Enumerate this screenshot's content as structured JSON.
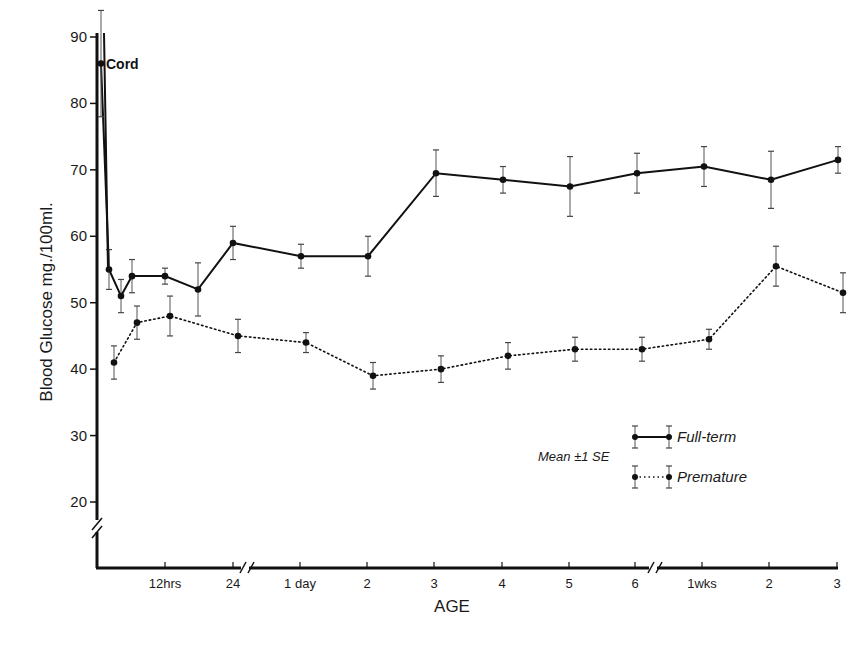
{
  "chart_data": {
    "type": "line",
    "title": "",
    "xlabel": "AGE",
    "ylabel": "Blood Glucose mg./100ml.",
    "ylim": [
      15,
      90
    ],
    "yticks": [
      20,
      30,
      40,
      50,
      60,
      70,
      80,
      90
    ],
    "x_tick_labels": [
      "12hrs",
      "24",
      "1 day",
      "2",
      "3",
      "4",
      "5",
      "6",
      "1wks",
      "2",
      "3"
    ],
    "x_axis_breaks": [
      "after 24 hrs",
      "after 6 days"
    ],
    "y_axis_break": "below 20",
    "annotations": [
      {
        "text": "Cord",
        "series": "Full-term",
        "value": 86
      }
    ],
    "legend": {
      "note": "Mean ±1 SE",
      "entries": [
        {
          "label": "Full-term",
          "style": "solid"
        },
        {
          "label": "Premature",
          "style": "dotted"
        }
      ],
      "position": "lower right"
    },
    "grid": false,
    "series": [
      {
        "name": "Full-term",
        "style": "solid",
        "points": [
          {
            "x": "Cord",
            "y": 86,
            "se": 8
          },
          {
            "x": "~1 hr",
            "y": 55,
            "se": 3
          },
          {
            "x": "~3 hrs",
            "y": 51,
            "se": 2.5
          },
          {
            "x": "~5 hrs",
            "y": 54,
            "se": 2.5
          },
          {
            "x": "12 hrs",
            "y": 54,
            "se": 1.2
          },
          {
            "x": "~18 hrs",
            "y": 52,
            "se": 4
          },
          {
            "x": "24 hrs",
            "y": 59,
            "se": 2.5
          },
          {
            "x": "1 day",
            "y": 57,
            "se": 1.8
          },
          {
            "x": "2 days",
            "y": 57,
            "se": 3
          },
          {
            "x": "3 days",
            "y": 69.5,
            "se": 3.5
          },
          {
            "x": "4 days",
            "y": 68.5,
            "se": 2
          },
          {
            "x": "5 days",
            "y": 67.5,
            "se": 4.5
          },
          {
            "x": "6 days",
            "y": 69.5,
            "se": 3
          },
          {
            "x": "1 wk",
            "y": 70.5,
            "se": 3
          },
          {
            "x": "2 wks",
            "y": 68.5,
            "se": 4.3
          },
          {
            "x": "3 wks",
            "y": 71.5,
            "se": 2
          }
        ]
      },
      {
        "name": "Premature",
        "style": "dotted",
        "points": [
          {
            "x": "~1 hr",
            "y": 41,
            "se": 2.5
          },
          {
            "x": "~5 hrs",
            "y": 47,
            "se": 2.5
          },
          {
            "x": "12 hrs",
            "y": 48,
            "se": 3
          },
          {
            "x": "24 hrs",
            "y": 45,
            "se": 2.5
          },
          {
            "x": "1 day",
            "y": 44,
            "se": 1.5
          },
          {
            "x": "2 days",
            "y": 39,
            "se": 2
          },
          {
            "x": "3 days",
            "y": 40,
            "se": 2
          },
          {
            "x": "4 days",
            "y": 42,
            "se": 2
          },
          {
            "x": "5 days",
            "y": 43,
            "se": 1.8
          },
          {
            "x": "6 days",
            "y": 43,
            "se": 1.8
          },
          {
            "x": "1 wk",
            "y": 44.5,
            "se": 1.5
          },
          {
            "x": "2 wks",
            "y": 55.5,
            "se": 3
          },
          {
            "x": "3 wks",
            "y": 51.5,
            "se": 3
          }
        ]
      }
    ]
  },
  "layout": {
    "plot_left": 97,
    "x_axis_y": 568,
    "y90_px": 37,
    "y20_px": 502,
    "x_positions": {
      "Cord": 101,
      "~1 hr": 109,
      "~3 hrs": 121,
      "~5 hrs": 132,
      "12 hrs": 165,
      "~18 hrs": 198,
      "24 hrs": 233,
      "1 day": 301,
      "2 days": 368,
      "3 days": 436,
      "4 days": 503,
      "5 days": 570,
      "6 days": 637,
      "1 wk": 704,
      "2 wks": 771,
      "3 wks": 838
    },
    "x_tick_px": [
      165,
      233,
      300,
      367,
      434,
      502,
      569,
      635,
      702,
      769,
      837
    ],
    "premature_offset_px": 5
  }
}
